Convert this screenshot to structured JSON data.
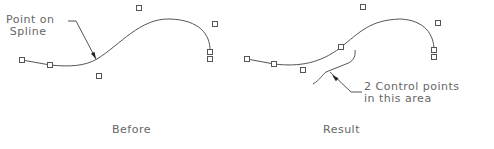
{
  "panels": [
    {
      "id": "before",
      "caption": "Before",
      "caption_pos": [
        112,
        124
      ],
      "annotation": {
        "lines": [
          "Point on",
          "Spline"
        ],
        "pos": [
          6,
          14
        ]
      },
      "curve": "M22,60 L50,65 C70,67 85,66 97,59 C120,45 140,18 170,19 C200,20 210,35 210,50",
      "leader": "M68,21 L76,21 L96,59",
      "arrow_tip": [
        96,
        59
      ],
      "control_points": [
        [
          22,
          60
        ],
        [
          50,
          65
        ],
        [
          99,
          76
        ],
        [
          139,
          8
        ],
        [
          215,
          24
        ],
        [
          210,
          52
        ],
        [
          210,
          59
        ]
      ]
    },
    {
      "id": "result",
      "caption": "Result",
      "caption_pos": [
        323,
        124
      ],
      "annotation": {
        "lines": [
          "2 Control points",
          "in this area"
        ],
        "pos": [
          364,
          81
        ]
      },
      "curve": "M247,59 L274,64 C300,67 320,63 340,48 C360,32 370,20 400,19 C425,20 434,35 434,50",
      "bracket": "M355,50 C356,58 352,62 346,64 L326,72 C323,74 320,80 313,84",
      "leader": "M330,72 L351,92 L362,92",
      "arrow_tip": [
        332,
        75
      ],
      "control_points": [
        [
          247,
          59
        ],
        [
          274,
          64
        ],
        [
          303,
          70
        ],
        [
          341,
          47
        ],
        [
          363,
          7
        ],
        [
          438,
          23
        ],
        [
          434,
          50
        ],
        [
          434,
          57
        ]
      ]
    }
  ],
  "colors": {
    "line": "#555555",
    "text": "#666666",
    "arrow": "#222222"
  }
}
